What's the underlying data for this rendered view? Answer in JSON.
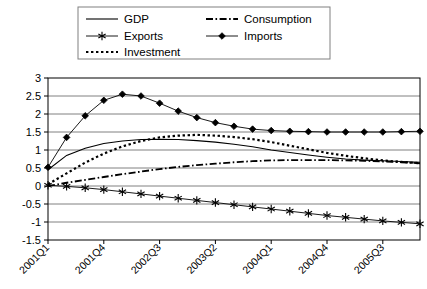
{
  "chart_data": {
    "type": "line",
    "title": "",
    "xlabel": "",
    "ylabel": "",
    "ylim": [
      -1.5,
      3
    ],
    "ytick_values": [
      -1.5,
      -1,
      -0.5,
      0,
      0.5,
      1,
      1.5,
      2,
      2.5,
      3
    ],
    "ytick_labels": [
      "-1.5",
      "-1",
      "-0.5",
      "0",
      "0.5",
      "1",
      "1.5",
      "2",
      "2.5",
      "3"
    ],
    "grid": true,
    "legend_position": "top",
    "categories": [
      "2001Q1",
      "2001Q2",
      "2001Q3",
      "2001Q4",
      "2002Q1",
      "2002Q2",
      "2002Q3",
      "2002Q4",
      "2003Q1",
      "2003Q2",
      "2003Q3",
      "2003Q4",
      "2004Q1",
      "2004Q2",
      "2004Q3",
      "2004Q4",
      "2005Q1",
      "2005Q2",
      "2005Q3",
      "2005Q4",
      "2006Q1"
    ],
    "xtick_labels": [
      "2001Q1",
      "2001Q4",
      "2002Q3",
      "2003Q2",
      "2004Q1",
      "2004Q4",
      "2005Q3"
    ],
    "xtick_indices": [
      0,
      3,
      6,
      9,
      12,
      15,
      18
    ],
    "series": [
      {
        "name": "GDP",
        "style": "solid",
        "marker": "none",
        "color": "#000000",
        "values": [
          0.45,
          0.85,
          1.05,
          1.18,
          1.25,
          1.29,
          1.3,
          1.29,
          1.26,
          1.22,
          1.16,
          1.09,
          1.0,
          0.93,
          0.86,
          0.8,
          0.75,
          0.72,
          0.7,
          0.68,
          0.66
        ]
      },
      {
        "name": "Exports",
        "style": "solid-thin",
        "marker": "star",
        "color": "#000000",
        "values": [
          0.02,
          -0.01,
          -0.05,
          -0.1,
          -0.16,
          -0.22,
          -0.28,
          -0.34,
          -0.4,
          -0.46,
          -0.52,
          -0.58,
          -0.64,
          -0.7,
          -0.76,
          -0.82,
          -0.87,
          -0.92,
          -0.97,
          -1.01,
          -1.05
        ]
      },
      {
        "name": "Investment",
        "style": "dotted",
        "marker": "none",
        "color": "#000000",
        "values": [
          0.05,
          0.35,
          0.65,
          0.9,
          1.1,
          1.25,
          1.35,
          1.4,
          1.42,
          1.4,
          1.36,
          1.3,
          1.22,
          1.12,
          1.02,
          0.92,
          0.84,
          0.77,
          0.71,
          0.67,
          0.63
        ]
      },
      {
        "name": "Consumption",
        "style": "dashdot",
        "marker": "none",
        "color": "#000000",
        "values": [
          0.0,
          0.09,
          0.17,
          0.25,
          0.33,
          0.4,
          0.47,
          0.53,
          0.58,
          0.62,
          0.66,
          0.69,
          0.71,
          0.72,
          0.72,
          0.72,
          0.71,
          0.7,
          0.68,
          0.66,
          0.63
        ]
      },
      {
        "name": "Imports",
        "style": "solid-thin",
        "marker": "diamond",
        "color": "#000000",
        "values": [
          0.52,
          1.35,
          1.95,
          2.38,
          2.55,
          2.5,
          2.3,
          2.08,
          1.9,
          1.76,
          1.66,
          1.58,
          1.54,
          1.52,
          1.51,
          1.5,
          1.5,
          1.5,
          1.5,
          1.51,
          1.52
        ]
      }
    ],
    "legend": [
      {
        "label": "GDP",
        "style": "solid",
        "marker": "none"
      },
      {
        "label": "Consumption",
        "style": "dashdot",
        "marker": "none"
      },
      {
        "label": "Exports",
        "style": "solid-thin",
        "marker": "star"
      },
      {
        "label": "Imports",
        "style": "solid-thin",
        "marker": "diamond"
      },
      {
        "label": "Investment",
        "style": "dotted",
        "marker": "none"
      }
    ],
    "colors": {
      "axis": "#000000",
      "grid": "#808080",
      "plot_border": "#000000",
      "legend_border": "#808080",
      "background": "#ffffff"
    }
  }
}
